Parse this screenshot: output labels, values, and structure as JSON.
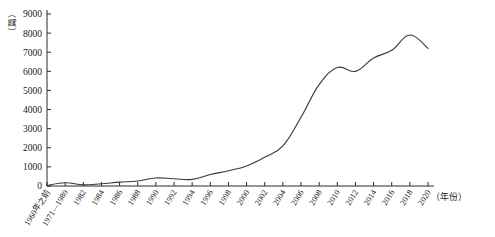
{
  "chart_data": {
    "type": "line",
    "title": "",
    "xlabel": "（年份）",
    "ylabel": "（篇）",
    "ylim": [
      0,
      9000
    ],
    "ytick_labels": [
      "0",
      "1000",
      "2000",
      "3000",
      "4000",
      "5000",
      "6000",
      "7000",
      "8000",
      "9000"
    ],
    "ytick_values": [
      0,
      1000,
      2000,
      3000,
      4000,
      5000,
      6000,
      7000,
      8000,
      9000
    ],
    "grid": false,
    "legend": "none",
    "categories": [
      "1960年之前",
      "1971—1980",
      "1982",
      "1984",
      "1986",
      "1988",
      "1990",
      "1992",
      "1994",
      "1996",
      "1998",
      "2000",
      "2002",
      "2004",
      "2006",
      "2008",
      "2010",
      "2012",
      "2014",
      "2016",
      "2018",
      "2020"
    ],
    "values": [
      30,
      170,
      60,
      120,
      200,
      260,
      420,
      380,
      350,
      600,
      800,
      1050,
      1500,
      2100,
      3600,
      5300,
      6200,
      6000,
      6700,
      7100,
      7900,
      7200
    ],
    "series": [
      {
        "name": "发文量",
        "values": [
          30,
          170,
          60,
          120,
          200,
          260,
          420,
          380,
          350,
          600,
          800,
          1050,
          1500,
          2100,
          3600,
          5300,
          6200,
          6000,
          6700,
          7100,
          7900,
          7200
        ]
      }
    ],
    "line_color": "#3a3a3a",
    "axis_color": "#2b2b2b",
    "peak_category": "2018",
    "peak_value": 7900
  }
}
